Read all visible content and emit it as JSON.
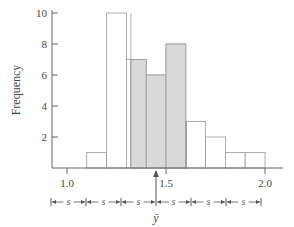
{
  "chart_data": {
    "type": "bar",
    "title": "",
    "xlabel": "",
    "ylabel": "Frequency",
    "bin_edges": [
      1.1,
      1.2,
      1.3,
      1.4,
      1.5,
      1.6,
      1.7,
      1.8,
      1.9,
      2.0
    ],
    "categories": [
      "1.1-1.2",
      "1.2-1.3",
      "1.3-1.4",
      "1.4-1.5",
      "1.5-1.6",
      "1.6-1.7",
      "1.7-1.8",
      "1.8-1.9",
      "1.9-2.0"
    ],
    "values": [
      1,
      10,
      7,
      6,
      8,
      3,
      2,
      1,
      1
    ],
    "xlim": [
      0.93,
      2.33
    ],
    "ylim": [
      0,
      10
    ],
    "x_ticks": [
      "1.0",
      "1.5",
      "2.0"
    ],
    "y_ticks": [
      "2",
      "4",
      "6",
      "8",
      "10"
    ],
    "grid": false,
    "legend": null,
    "annotations": {
      "mean_label": "ȳ",
      "mean_value_approx": 1.445,
      "std_label": "s",
      "std_segments": 6,
      "shaded_region": "ȳ − s to ȳ + s"
    }
  },
  "axis": {
    "ylabel": "Frequency",
    "x_ticks": [
      "1.0",
      "1.5",
      "2.0"
    ],
    "y_ticks": [
      "2",
      "4",
      "6",
      "8",
      "10"
    ]
  },
  "annotation": {
    "mean_label": "ȳ",
    "s_label": "s"
  },
  "colors": {
    "shade": "#d9d9d9",
    "bar_edge": "#999999",
    "axis": "#666666"
  }
}
